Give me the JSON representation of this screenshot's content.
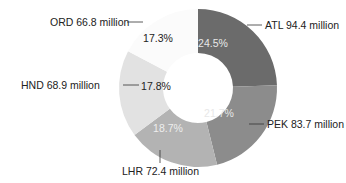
{
  "chart_data": {
    "type": "pie",
    "subtype": "donut",
    "title": "",
    "categories": [
      "ATL",
      "PEK",
      "LHR",
      "HND",
      "ORD"
    ],
    "values": [
      94.4,
      83.7,
      72.4,
      68.9,
      66.8
    ],
    "unit": "million",
    "percentages": [
      24.5,
      21.7,
      18.7,
      17.8,
      17.3
    ],
    "percent_labels": [
      "24.5%",
      "21.7%",
      "18.7%",
      "17.8%",
      "17.3%"
    ],
    "slice_labels": [
      "ATL 94.4 million",
      "PEK 83.7 million",
      "LHR 72.4 million",
      "HND 68.9 million",
      "ORD 66.8 million"
    ],
    "colors": [
      "#6b6b6b",
      "#8c8c8c",
      "#b3b3b3",
      "#e2e2e2",
      "#fbfbfb"
    ],
    "percent_label_colors": [
      "#e8e8e8",
      "#e8e8e8",
      "#eeeeee",
      "#222222",
      "#222222"
    ],
    "start_angle_deg": 0,
    "direction": "clockwise",
    "legend": "none"
  }
}
